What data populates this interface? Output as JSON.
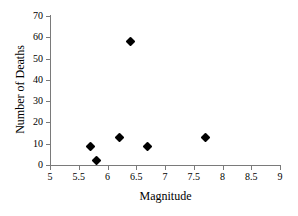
{
  "chart_data": {
    "type": "scatter",
    "title": "",
    "xlabel": "Magnitude",
    "ylabel": "Number of Deaths",
    "xlim": [
      5,
      9
    ],
    "ylim": [
      0,
      70
    ],
    "xticks": [
      5,
      5.5,
      6,
      6.5,
      7,
      7.5,
      8,
      8.5,
      9
    ],
    "xtick_labels": [
      "5",
      "5.5",
      "6",
      "6.5",
      "7",
      "7.5",
      "8",
      "8.5",
      "9"
    ],
    "yticks": [
      0,
      10,
      20,
      30,
      40,
      50,
      60,
      70
    ],
    "ytick_labels": [
      "0",
      "10",
      "20",
      "30",
      "40",
      "50",
      "60",
      "70"
    ],
    "grid": false,
    "legend": null,
    "marker": "diamond",
    "marker_color": "#000000",
    "axis_color": "#7a7a7a",
    "points": [
      {
        "x": 5.7,
        "y": 8.5
      },
      {
        "x": 5.8,
        "y": 2
      },
      {
        "x": 6.2,
        "y": 13
      },
      {
        "x": 6.4,
        "y": 58
      },
      {
        "x": 6.7,
        "y": 8.5
      },
      {
        "x": 7.7,
        "y": 13
      }
    ]
  }
}
